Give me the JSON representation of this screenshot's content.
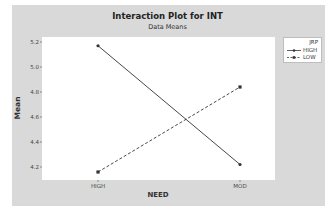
{
  "chart": {
    "title": "Interaction Plot for INT",
    "subtitle": "Data Means",
    "xlabel": "NEED",
    "ylabel": "Mean",
    "y_ticks": [
      "5.2",
      "5.0",
      "4.8",
      "4.6",
      "4.4",
      "4.2"
    ],
    "x_ticks": [
      "HIGH",
      "MOD"
    ],
    "legend": {
      "title": "JRP",
      "items": [
        {
          "label": "HIGH",
          "style": "solid",
          "marker": "circle"
        },
        {
          "label": "LOW",
          "style": "dashed",
          "marker": "square"
        }
      ]
    },
    "colors": {
      "frame": "#d9d9d9",
      "plot_bg": "#ffffff",
      "line": "#333333"
    }
  },
  "chart_data": {
    "type": "line",
    "title": "Interaction Plot for INT",
    "subtitle": "Data Means",
    "xlabel": "NEED",
    "ylabel": "Mean",
    "categories": [
      "HIGH",
      "MOD"
    ],
    "series": [
      {
        "name": "HIGH",
        "legend_group": "JRP",
        "line_style": "solid",
        "marker": "circle",
        "values": [
          5.17,
          4.22
        ]
      },
      {
        "name": "LOW",
        "legend_group": "JRP",
        "line_style": "dashed",
        "marker": "square",
        "values": [
          4.16,
          4.84
        ]
      }
    ],
    "y_ticks": [
      4.2,
      4.4,
      4.6,
      4.8,
      5.0,
      5.2
    ],
    "ylim": [
      4.12,
      5.24
    ],
    "grid": false,
    "legend_position": "right",
    "legend_title": "JRP"
  }
}
